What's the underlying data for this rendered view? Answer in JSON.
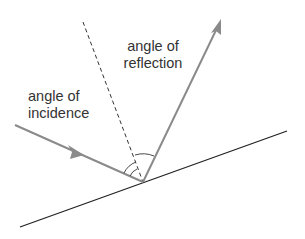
{
  "diagram": {
    "labels": {
      "reflection_line1": "angle of",
      "reflection_line2": "reflection",
      "incidence_line1": "angle of",
      "incidence_line2": "incidence"
    },
    "colors": {
      "ray": "#8a8a8a",
      "surface": "#222222",
      "normal": "#333333",
      "text": "#333333"
    }
  }
}
